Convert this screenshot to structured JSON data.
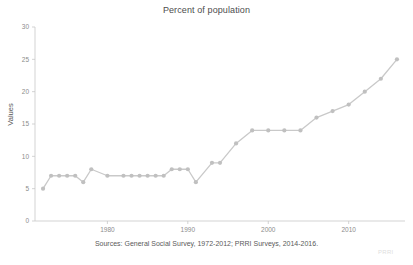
{
  "title": "Percent of population",
  "source_note": "Sources: General Social Survey, 1972-2012; PRRI Surveys, 2014-2016.",
  "watermark": "PRRI",
  "colors": {
    "series": "#c9c9c9",
    "marker": "#c0c0c0",
    "axis": "#c8c8c8",
    "tick_text": "#8c8c8c",
    "title_text": "#4d4d4d",
    "background": "#ffffff"
  },
  "chart_data": {
    "type": "line",
    "title": "Percent of population",
    "xlabel": "",
    "ylabel": "Values",
    "xlim": [
      1971,
      2017
    ],
    "ylim": [
      0,
      30
    ],
    "xticks": [
      "1980",
      "1990",
      "2000",
      "2010"
    ],
    "xtick_values": [
      1980,
      1990,
      2000,
      2010
    ],
    "yticks": [
      "0",
      "5",
      "10",
      "15",
      "20",
      "25",
      "30"
    ],
    "ytick_values": [
      0,
      5,
      10,
      15,
      20,
      25,
      30
    ],
    "grid": false,
    "legend": null,
    "series": [
      {
        "name": "Percent of population",
        "x": [
          1972,
          1973,
          1974,
          1975,
          1976,
          1977,
          1978,
          1980,
          1982,
          1983,
          1984,
          1985,
          1986,
          1987,
          1988,
          1989,
          1990,
          1991,
          1993,
          1994,
          1996,
          1998,
          2000,
          2002,
          2004,
          2006,
          2008,
          2010,
          2012,
          2014,
          2016
        ],
        "values": [
          5,
          7,
          7,
          7,
          7,
          6,
          8,
          7,
          7,
          7,
          7,
          7,
          7,
          7,
          8,
          8,
          8,
          6,
          9,
          9,
          12,
          14,
          14,
          14,
          14,
          16,
          17,
          18,
          20,
          22,
          25
        ]
      }
    ]
  },
  "axis_label": {
    "y": "Values"
  }
}
